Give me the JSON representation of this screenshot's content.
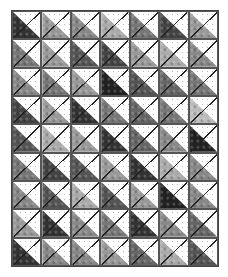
{
  "quilt": {
    "columns": 7,
    "rows": 9,
    "block_type": "half-square-triangle",
    "background_color": "#fdfdfd",
    "dot_color": "#b8b8b8",
    "seam_color": "#222222",
    "fabric_tones": [
      [
        "#333333",
        "#999999",
        "#888888",
        "#aaaaaa",
        "#777777",
        "#444444",
        "#999999"
      ],
      [
        "#777777",
        "#999999",
        "#555555",
        "#444444",
        "#999999",
        "#aaaaaa",
        "#888888"
      ],
      [
        "#888888",
        "#777777",
        "#999999",
        "#222222",
        "#555555",
        "#666666",
        "#777777"
      ],
      [
        "#444444",
        "#999999",
        "#333333",
        "#777777",
        "#666666",
        "#777777",
        "#bbbbbb"
      ],
      [
        "#555555",
        "#aaaaaa",
        "#999999",
        "#333333",
        "#666666",
        "#888888",
        "#222222"
      ],
      [
        "#777777",
        "#444444",
        "#555555",
        "#999999",
        "#333333",
        "#aaaaaa",
        "#888888"
      ],
      [
        "#888888",
        "#555555",
        "#aaaaaa",
        "#555555",
        "#999999",
        "#222222",
        "#888888"
      ],
      [
        "#999999",
        "#333333",
        "#888888",
        "#777777",
        "#333333",
        "#888888",
        "#666666"
      ],
      [
        "#333333",
        "#888888",
        "#888888",
        "#999999",
        "#666666",
        "#aaaaaa",
        "#555555"
      ]
    ]
  }
}
